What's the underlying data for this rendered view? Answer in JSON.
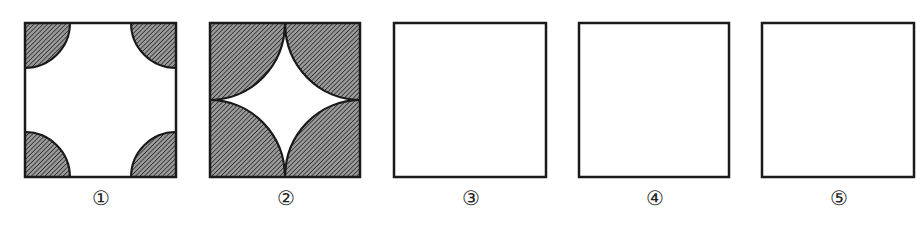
{
  "figure": {
    "colors": {
      "stroke": "#1a1a1a",
      "hatch_bg": "#8a8a8a",
      "hatch_line": "#2a2a2a",
      "fill": "#ffffff"
    },
    "panels": [
      {
        "label": "①",
        "type": "small-corner-arcs",
        "x": 25
      },
      {
        "label": "②",
        "type": "half-side-corner-arcs",
        "x": 210
      },
      {
        "label": "③",
        "type": "empty",
        "x": 394
      },
      {
        "label": "④",
        "type": "empty",
        "x": 579
      },
      {
        "label": "⑤",
        "type": "empty",
        "x": 762
      }
    ]
  }
}
